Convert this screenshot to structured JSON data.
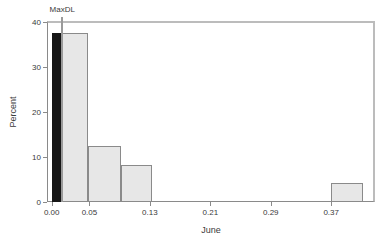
{
  "chart_data": {
    "type": "histogram",
    "title": "",
    "xlabel": "June",
    "ylabel": "Percent",
    "xlim": [
      -0.0062,
      0.428
    ],
    "ylim": [
      0,
      40.2
    ],
    "grid": false,
    "legend": "none",
    "x_ticks": [
      {
        "value": 0.0,
        "label": "0.00"
      },
      {
        "value": 0.05,
        "label": "0.05"
      },
      {
        "value": 0.13,
        "label": "0.13"
      },
      {
        "value": 0.21,
        "label": "0.21"
      },
      {
        "value": 0.29,
        "label": "0.29"
      },
      {
        "value": 0.37,
        "label": "0.37"
      }
    ],
    "y_ticks": [
      {
        "value": 0,
        "label": "0"
      },
      {
        "value": 10,
        "label": "10"
      },
      {
        "value": 20,
        "label": "20"
      },
      {
        "value": 30,
        "label": "30"
      },
      {
        "value": 40,
        "label": "40"
      }
    ],
    "bars": [
      {
        "x0": 0.0,
        "x1": 0.0485,
        "percent": 37.5
      },
      {
        "x0": 0.0485,
        "x1": 0.092,
        "percent": 12.5
      },
      {
        "x0": 0.092,
        "x1": 0.1325,
        "percent": 8.3
      },
      {
        "x0": 0.37,
        "x1": 0.412,
        "percent": 4.2
      }
    ],
    "nondetect_bar": {
      "x0": 0.0005,
      "x1": 0.0125,
      "percent": 37.5
    },
    "reference_line": {
      "label": "MaxDL",
      "x": 0.014
    }
  },
  "colors": {
    "background": "#ffffff",
    "bar_fill": "#e7e7e7",
    "bar_outline": "#8a8a8a",
    "nondetect_fill": "#161616",
    "axis": "#8a8a8a",
    "frame": "#bcbcbc",
    "reference_line": "#9a9a9a",
    "text": "#3a3a3a"
  }
}
